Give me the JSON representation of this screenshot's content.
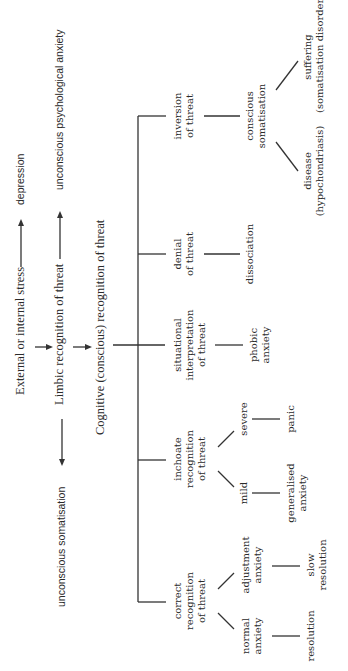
{
  "top": {
    "stress": "External or internal stress",
    "depression": "depression",
    "limbic": "Limbic recognition of threat",
    "unconscious_psych": "unconscious psychological anxiety",
    "unconscious_soma": "unconscious somatisation",
    "cognitive": "Cognitive (conscious) recognition of threat"
  },
  "branches": [
    {
      "label": [
        "correct",
        "recognition",
        "of threat"
      ],
      "children": [
        {
          "label": [
            "normal",
            "anxiety"
          ],
          "outcome": [
            "resolution"
          ]
        },
        {
          "label": [
            "adjustment",
            "anxiety"
          ],
          "outcome": [
            "slow",
            "resolution"
          ]
        }
      ]
    },
    {
      "label": [
        "inchoate",
        "recognition",
        "of threat"
      ],
      "children": [
        {
          "label": [
            "mild"
          ],
          "outcome": [
            "generalised",
            "anxiety"
          ]
        },
        {
          "label": [
            "severe"
          ],
          "outcome": [
            "panic"
          ]
        }
      ]
    },
    {
      "label": [
        "situational",
        "interpretation",
        "of threat"
      ],
      "outcome": [
        "phobic",
        "anxiety"
      ]
    },
    {
      "label": [
        "denial",
        "of threat"
      ],
      "outcome": [
        "dissociation"
      ]
    },
    {
      "label": [
        "inversion",
        "of threat"
      ],
      "middle": [
        "conscious",
        "somatisation"
      ],
      "children": [
        {
          "outcome": [
            "disease",
            "(hypochondriasis)"
          ]
        },
        {
          "outcome": [
            "suffering",
            "(somatisation disorder)"
          ]
        }
      ]
    }
  ]
}
